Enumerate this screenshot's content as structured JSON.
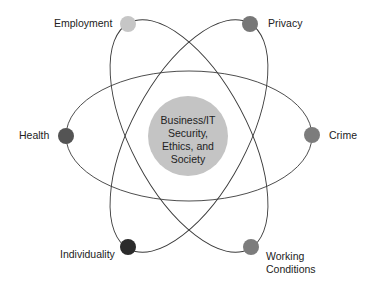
{
  "diagram": {
    "center": {
      "lines": [
        "Business/IT",
        "Security,",
        "Ethics, and",
        "Society"
      ],
      "color": "#c4c4c4"
    },
    "nodes": [
      {
        "id": "employment",
        "label": "Employment",
        "color": "#c6c6c6"
      },
      {
        "id": "privacy",
        "label": "Privacy",
        "color": "#777777"
      },
      {
        "id": "health",
        "label": "Health",
        "color": "#545454"
      },
      {
        "id": "crime",
        "label": "Crime",
        "color": "#7c7c7c"
      },
      {
        "id": "individuality",
        "label": "Individuality",
        "color": "#2b2b2b"
      },
      {
        "id": "working-conditions",
        "label_lines": [
          "Working",
          "Conditions"
        ],
        "color": "#7c7c7c"
      }
    ]
  }
}
